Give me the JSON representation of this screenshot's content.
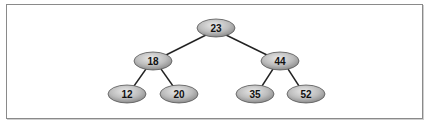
{
  "diagram": {
    "type": "binary-search-tree",
    "root": "23",
    "nodes": [
      {
        "id": "n23",
        "label": "23",
        "cx": 216,
        "cy": 28
      },
      {
        "id": "n18",
        "label": "18",
        "cx": 153,
        "cy": 61
      },
      {
        "id": "n44",
        "label": "44",
        "cx": 280,
        "cy": 61
      },
      {
        "id": "n12",
        "label": "12",
        "cx": 127,
        "cy": 94
      },
      {
        "id": "n20",
        "label": "20",
        "cx": 179,
        "cy": 94
      },
      {
        "id": "n35",
        "label": "35",
        "cx": 255,
        "cy": 94
      },
      {
        "id": "n52",
        "label": "52",
        "cx": 306,
        "cy": 94
      }
    ],
    "edges": [
      {
        "from": "23",
        "to": "18"
      },
      {
        "from": "23",
        "to": "44"
      },
      {
        "from": "18",
        "to": "12"
      },
      {
        "from": "18",
        "to": "20"
      },
      {
        "from": "44",
        "to": "35"
      },
      {
        "from": "44",
        "to": "52"
      }
    ],
    "colors": {
      "node_fill_light": "#e4e4e4",
      "node_fill_dark": "#8c8c8c",
      "node_stroke": "#555555",
      "edge": "#222222",
      "border": "#8a8a8a"
    }
  }
}
